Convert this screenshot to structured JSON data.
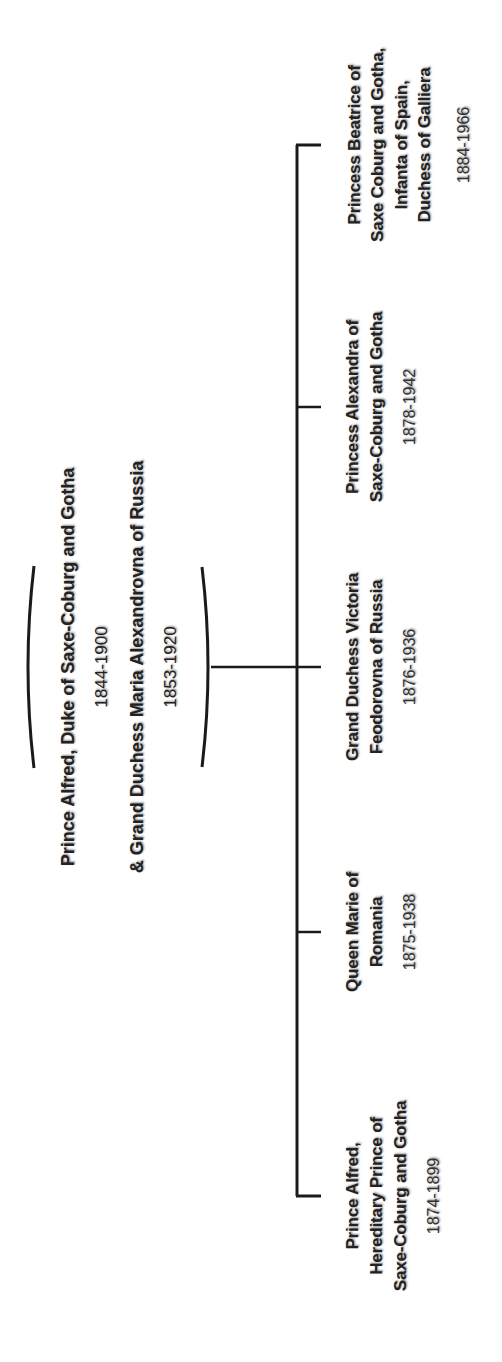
{
  "parents": {
    "father": {
      "name": "Prince Alfred, Duke of Saxe-Coburg and Gotha",
      "dates": "1844-1900"
    },
    "mother": {
      "name": "& Grand Duchess Maria Alexandrovna of Russia",
      "dates": "1853-1920"
    }
  },
  "children": [
    {
      "lines": [
        "Prince Alfred,",
        "Hereditary Prince of",
        "Saxe-Coburg and Gotha"
      ],
      "dates": "1874-1899"
    },
    {
      "lines": [
        "Queen Marie of",
        "Romania"
      ],
      "dates": "1875-1938"
    },
    {
      "lines": [
        "Grand Duchess Victoria",
        "Feodorovna of Russia"
      ],
      "dates": "1876-1936"
    },
    {
      "lines": [
        "Princess Alexandra of",
        "Saxe-Coburg and Gotha"
      ],
      "dates": "1878-1942"
    },
    {
      "lines": [
        "Princess Beatrice of",
        "Saxe Coburg and Gotha,",
        "Infanta of Spain,",
        "Duchess of Galliera"
      ],
      "dates": "1884-1966"
    }
  ],
  "style": {
    "line_color": "#1a1a1a",
    "text_color": "#222222",
    "background": "#ffffff"
  }
}
